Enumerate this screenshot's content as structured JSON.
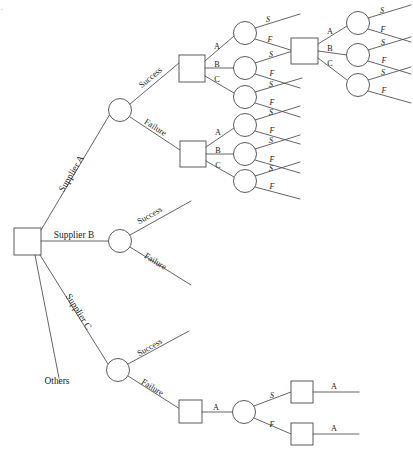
{
  "diagram": {
    "type": "decision-tree",
    "background_color": "#ffffff",
    "line_color": "#4a4a4a",
    "text_color": "#1a1a1a",
    "root": {
      "shape": "square",
      "name": "root-decision-node"
    },
    "root_branches": [
      {
        "label": "Supplier A",
        "id": "supplier-a"
      },
      {
        "label": "Supplier B",
        "id": "supplier-b"
      },
      {
        "label": "Supplier C",
        "id": "supplier-c"
      },
      {
        "label": "Others",
        "id": "others"
      }
    ],
    "chance_outcomes": {
      "success": "Success",
      "failure": "Failure"
    },
    "decision_options": [
      "A",
      "B",
      "C"
    ],
    "terminal_outcomes": {
      "s": "S",
      "f": "F"
    },
    "single_option": "A",
    "branch_a": {
      "supplier_label": "Supplier A",
      "success_label": "Success",
      "failure_label": "Failure",
      "success_square_options": [
        "A",
        "B",
        "C"
      ],
      "failure_square_options": [
        "A",
        "B",
        "C"
      ],
      "second_square_options": [
        "A",
        "B",
        "C"
      ],
      "chance_labels": [
        "S",
        "F"
      ]
    },
    "branch_b": {
      "supplier_label": "Supplier B",
      "success_label": "Success",
      "failure_label": "Failure"
    },
    "branch_c": {
      "supplier_label": "Supplier C",
      "success_label": "Success",
      "failure_label": "Failure",
      "option_label": "A",
      "chance_labels": [
        "S",
        "F"
      ],
      "terminal_option_labels": [
        "A",
        "A"
      ]
    },
    "branch_others": {
      "label": "Others"
    },
    "corner_mark": "."
  }
}
